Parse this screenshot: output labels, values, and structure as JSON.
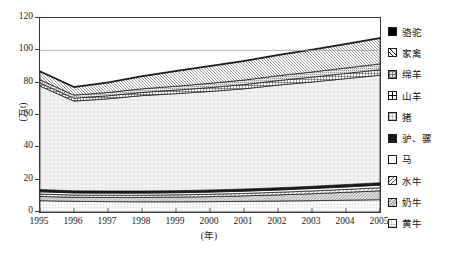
{
  "chart_data": {
    "type": "area",
    "title": "",
    "subtitle": "",
    "xlabel": "(年)",
    "ylabel": "(万t)",
    "stacked": true,
    "grid": false,
    "legend_position": "right",
    "xlim": [
      1995,
      2005
    ],
    "ylim": [
      0,
      120
    ],
    "y_ticks": [
      120,
      100,
      80,
      60,
      40,
      20,
      0
    ],
    "x": [
      1995,
      1996,
      1997,
      1998,
      1999,
      2000,
      2001,
      2002,
      2003,
      2004,
      2005
    ],
    "categories": [
      "1995",
      "1996",
      "1997",
      "1998",
      "1999",
      "2000",
      "2001",
      "2002",
      "2003",
      "2004",
      "2005"
    ],
    "series": [
      {
        "name": "黄牛",
        "pattern": "faint-grid",
        "values": [
          7.0,
          6.6,
          6.4,
          6.3,
          6.3,
          6.4,
          6.6,
          6.8,
          7.0,
          7.3,
          7.6
        ]
      },
      {
        "name": "奶牛",
        "pattern": "grey-diag",
        "values": [
          2.6,
          2.5,
          2.6,
          2.7,
          2.9,
          3.1,
          3.4,
          3.8,
          4.3,
          4.9,
          5.5
        ]
      },
      {
        "name": "水牛",
        "pattern": "diag-back",
        "values": [
          1.5,
          1.4,
          1.4,
          1.4,
          1.4,
          1.5,
          1.5,
          1.6,
          1.7,
          1.8,
          1.9
        ]
      },
      {
        "name": "马",
        "pattern": "plain-white",
        "values": [
          1.4,
          1.3,
          1.3,
          1.3,
          1.3,
          1.3,
          1.4,
          1.4,
          1.5,
          1.5,
          1.6
        ]
      },
      {
        "name": "驴、骡",
        "pattern": "dark-block",
        "values": [
          1.4,
          1.3,
          1.3,
          1.3,
          1.3,
          1.3,
          1.3,
          1.4,
          1.4,
          1.5,
          1.5
        ]
      },
      {
        "name": "猪",
        "pattern": "white-speck",
        "values": [
          64.0,
          55.5,
          57.0,
          59.0,
          60.0,
          61.0,
          62.0,
          63.5,
          64.5,
          65.5,
          66.5
        ]
      },
      {
        "name": "山羊",
        "pattern": "grid-cross",
        "values": [
          1.9,
          1.8,
          1.9,
          2.0,
          2.2,
          2.4,
          2.6,
          2.8,
          3.0,
          3.2,
          3.4
        ]
      },
      {
        "name": "绵羊",
        "pattern": "dots-dense",
        "values": [
          2.0,
          1.9,
          2.0,
          2.2,
          2.4,
          2.6,
          2.8,
          3.0,
          3.2,
          3.4,
          3.6
        ]
      },
      {
        "name": "家禽",
        "pattern": "diag-light",
        "values": [
          5.0,
          4.8,
          6.0,
          7.6,
          9.2,
          10.5,
          11.6,
          12.6,
          13.6,
          14.6,
          15.8
        ]
      },
      {
        "name": "骆驼",
        "pattern": "solid-black",
        "values": [
          0.5,
          0.5,
          0.5,
          0.5,
          0.5,
          0.5,
          0.5,
          0.5,
          0.5,
          0.5,
          0.5
        ]
      }
    ],
    "totals": [
      87.3,
      77.6,
      80.4,
      84.3,
      87.5,
      90.6,
      93.7,
      97.4,
      100.7,
      104.2,
      107.9
    ],
    "reference_line": 100
  },
  "legend": {
    "items": [
      {
        "label": "骆驼",
        "swatch": "solid-black"
      },
      {
        "label": "家禽",
        "swatch": "diag-light"
      },
      {
        "label": "绵羊",
        "swatch": "dots-dense"
      },
      {
        "label": "山羊",
        "swatch": "grid-cross"
      },
      {
        "label": "猪",
        "swatch": "white-speck"
      },
      {
        "label": "驴、骡",
        "swatch": "dark-block"
      },
      {
        "label": "马",
        "swatch": "plain-white"
      },
      {
        "label": "水牛",
        "swatch": "diag-back"
      },
      {
        "label": "奶牛",
        "swatch": "grey-diag"
      },
      {
        "label": "黄牛",
        "swatch": "faint-grid"
      }
    ]
  },
  "colors": {
    "axis": "#3a3a3a",
    "text": "#1a1a1a",
    "background": "#ffffff",
    "reference_line": "#9a9a9a"
  }
}
